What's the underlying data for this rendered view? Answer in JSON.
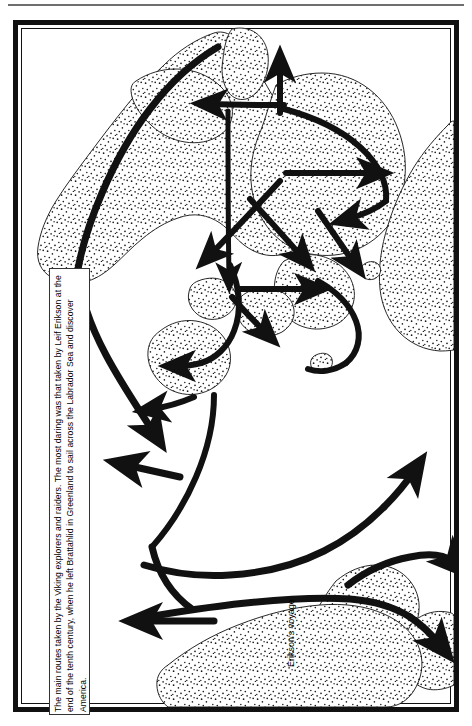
{
  "figure": {
    "type": "historical-route-map",
    "title_visible": false,
    "caption": "The main routes taken by the Viking explorers and raiders. The most daring was that taken by Leif Erikson at the end of the tenth century, when he left Brattahlid in Greenland to sail across the Labrador Sea and discover America.",
    "annotations": [
      {
        "id": "eriksons-voyage",
        "text": "Erikson's\nvoyage",
        "rotated_deg": -90
      }
    ],
    "orientation_note": "page content rotated 90 degrees (landscape map on portrait page)",
    "colors": {
      "ink": "#111111",
      "paper": "#ffffff",
      "rule": "#6e6e6e",
      "stipple": "#1a1a1a"
    },
    "frame": {
      "outer_border_px": 5,
      "inner_border_px": 1.5
    },
    "legend_items": [],
    "landmasses": [
      "Greenland",
      "Baffin Island / Arctic Canada",
      "Labrador",
      "Newfoundland",
      "Iceland",
      "Scandinavia",
      "British Isles",
      "Ireland"
    ],
    "route_count": 14,
    "arrowheads": 16
  }
}
